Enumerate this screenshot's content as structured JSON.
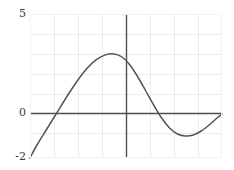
{
  "chart_data": {
    "type": "line",
    "title": "",
    "xlabel": "",
    "ylabel": "",
    "xlim": [
      -4.85,
      4.85
    ],
    "ylim": [
      -2.2,
      5.0
    ],
    "grid": true,
    "legend": null,
    "y_tick_labels": [
      "5",
      "0",
      "-2"
    ],
    "y_ticks_values": [
      5,
      0,
      -2
    ],
    "x_tick_labels": [],
    "gridlines_y": [
      5,
      4,
      3,
      2,
      1,
      0,
      -1,
      -2
    ],
    "gridlines_x": [
      -4,
      -3,
      -2,
      -1,
      0,
      1,
      2,
      3,
      4
    ],
    "axis_lines": {
      "x_axis_at_y": 0,
      "y_axis_at_x": 0
    },
    "series": [
      {
        "name": "curve",
        "color": "#555555",
        "points": [
          [
            -4.85,
            -2.2
          ],
          [
            -4.5,
            -1.55
          ],
          [
            -4.0,
            -0.75
          ],
          [
            -3.5,
            0.05
          ],
          [
            -3.0,
            0.85
          ],
          [
            -2.5,
            1.6
          ],
          [
            -2.0,
            2.25
          ],
          [
            -1.5,
            2.72
          ],
          [
            -1.0,
            2.97
          ],
          [
            -0.6,
            3.0
          ],
          [
            -0.2,
            2.85
          ],
          [
            0.2,
            2.45
          ],
          [
            0.6,
            1.85
          ],
          [
            1.0,
            1.15
          ],
          [
            1.4,
            0.45
          ],
          [
            1.8,
            -0.2
          ],
          [
            2.2,
            -0.7
          ],
          [
            2.6,
            -1.0
          ],
          [
            3.0,
            -1.1
          ],
          [
            3.4,
            -1.05
          ],
          [
            3.8,
            -0.85
          ],
          [
            4.2,
            -0.55
          ],
          [
            4.6,
            -0.2
          ],
          [
            4.85,
            0.0
          ]
        ]
      }
    ],
    "colors": {
      "curve": "#555555",
      "axis": "#4d4d4d",
      "grid": "#ececec",
      "frame": "#f2f2f2",
      "background": "#ffffff",
      "tick_text": "#3a3a3a"
    }
  }
}
